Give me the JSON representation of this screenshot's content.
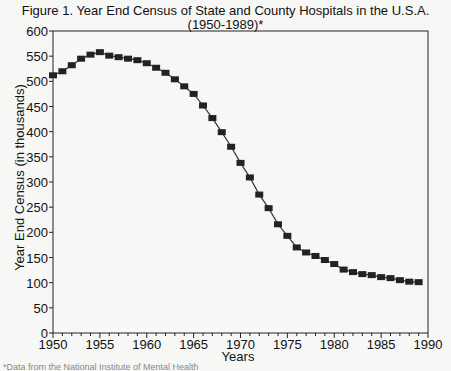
{
  "chart_data": {
    "type": "line",
    "title": "Figure 1. Year End Census of State and County Hospitals in the U.S.A.",
    "subtitle": "(1950-1989)*",
    "xlabel": "Years",
    "ylabel": "Year End Census (in thousands)",
    "xlim": [
      1950,
      1990
    ],
    "ylim": [
      0,
      600
    ],
    "x_ticks": [
      "1950",
      "1955",
      "1960",
      "1965",
      "1970",
      "1975",
      "1980",
      "1985",
      "1990"
    ],
    "y_ticks": [
      "0",
      "50",
      "100",
      "150",
      "200",
      "250",
      "300",
      "350",
      "400",
      "450",
      "500",
      "550",
      "600"
    ],
    "grid": false,
    "legend": null,
    "marker": "square",
    "series": [
      {
        "name": "Year End Census",
        "x": [
          1950,
          1951,
          1952,
          1953,
          1954,
          1955,
          1956,
          1957,
          1958,
          1959,
          1960,
          1961,
          1962,
          1963,
          1964,
          1965,
          1966,
          1967,
          1968,
          1969,
          1970,
          1971,
          1972,
          1973,
          1974,
          1975,
          1976,
          1977,
          1978,
          1979,
          1980,
          1981,
          1982,
          1983,
          1984,
          1985,
          1986,
          1987,
          1988,
          1989
        ],
        "values": [
          512,
          520,
          532,
          545,
          553,
          558,
          551,
          548,
          545,
          542,
          536,
          527,
          517,
          504,
          490,
          475,
          452,
          427,
          399,
          370,
          338,
          309,
          275,
          248,
          216,
          193,
          170,
          160,
          153,
          145,
          137,
          126,
          121,
          117,
          115,
          111,
          109,
          105,
          102,
          101
        ]
      }
    ],
    "footnote": "*Data from the National Institute of Mental Health"
  }
}
